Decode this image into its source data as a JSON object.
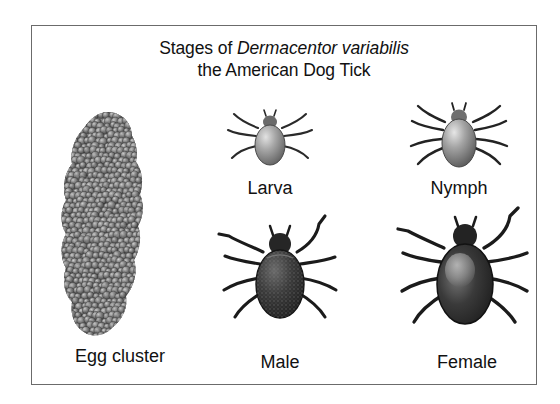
{
  "figure": {
    "background_color": "#ffffff",
    "border_color": "#6b6b6b",
    "title": {
      "line1_prefix": "Stages of ",
      "line1_species": "Dermacentor variabilis",
      "line2": "the American Dog Tick"
    },
    "stages": [
      {
        "id": "egg",
        "label": "Egg cluster",
        "art": "egg-cluster-illustration",
        "description": "elongated vertical mass of hundreds of small gray spherical eggs"
      },
      {
        "id": "larva",
        "label": "Larva",
        "art": "tick-larva-illustration",
        "description": "small pale gray six-legged tick, dorsal view"
      },
      {
        "id": "nymph",
        "label": "Nymph",
        "art": "tick-nymph-illustration",
        "description": "medium pale gray eight-legged tick, dorsal view"
      },
      {
        "id": "male",
        "label": "Male",
        "art": "tick-male-adult-illustration",
        "description": "dark adult male tick with mottled ornate dorsal shield covering whole body"
      },
      {
        "id": "female",
        "label": "Female",
        "art": "tick-female-adult-illustration",
        "description": "large dark adult female tick with pale scutum behind the capitulum"
      }
    ]
  },
  "colors": {
    "text": "#111111",
    "egg_dark": "#4a4a4a",
    "egg_light": "#b8b8b8",
    "tick_pale_body": "#9a9a9a",
    "tick_dark_body": "#2e2e2e",
    "leg_stroke": "#1c1c1c"
  }
}
